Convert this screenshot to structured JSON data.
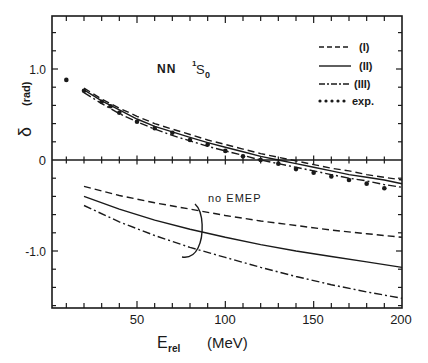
{
  "chart_data": {
    "type": "line",
    "title": "",
    "annotation_top": "NN ¹S₀",
    "annotation_top_parts": {
      "prefix": "NN",
      "sup": "1",
      "main": "S",
      "sub": "0"
    },
    "annotation_bottom": "no EMEP",
    "xlabel": "E_rel (MeV)",
    "xlabel_parts": {
      "main": "E",
      "sub": "rel",
      "unit": "(MeV)"
    },
    "ylabel": "δ (rad)",
    "ylabel_parts": {
      "symbol": "δ",
      "unit": "(rad)"
    },
    "xlim": [
      2,
      200
    ],
    "ylim": [
      -1.62,
      1.58
    ],
    "x_ticks": [
      50,
      100,
      150,
      200
    ],
    "x_tick_labels": [
      "50",
      "100",
      "150",
      "200"
    ],
    "y_ticks": [
      1.0,
      0,
      -1.0
    ],
    "y_tick_labels": [
      "1.0",
      "0",
      "-1.0"
    ],
    "grid": false,
    "legend_position": "upper right",
    "legend": [
      {
        "label": "(I)",
        "style": "dashed"
      },
      {
        "label": "(II)",
        "style": "solid"
      },
      {
        "label": "(III)",
        "style": "dash-dot"
      },
      {
        "label": "exp.",
        "style": "dots"
      }
    ],
    "series": [
      {
        "name": "(I)",
        "style": "dashed",
        "panel": "with EMEP",
        "x": [
          20,
          30,
          40,
          50,
          60,
          70,
          80,
          90,
          100,
          110,
          120,
          130,
          140,
          150,
          160,
          170,
          180,
          190,
          200
        ],
        "values": [
          0.79,
          0.67,
          0.57,
          0.48,
          0.4,
          0.34,
          0.28,
          0.22,
          0.17,
          0.12,
          0.07,
          0.03,
          -0.01,
          -0.05,
          -0.09,
          -0.12,
          -0.16,
          -0.19,
          -0.22
        ]
      },
      {
        "name": "(II)",
        "style": "solid",
        "panel": "with EMEP",
        "x": [
          20,
          30,
          40,
          50,
          60,
          70,
          80,
          90,
          100,
          110,
          120,
          130,
          140,
          150,
          160,
          170,
          180,
          190,
          200
        ],
        "values": [
          0.77,
          0.65,
          0.55,
          0.45,
          0.37,
          0.31,
          0.25,
          0.19,
          0.14,
          0.09,
          0.04,
          0.0,
          -0.04,
          -0.08,
          -0.12,
          -0.16,
          -0.19,
          -0.22,
          -0.26
        ]
      },
      {
        "name": "(III)",
        "style": "dash-dot",
        "panel": "with EMEP",
        "x": [
          20,
          30,
          40,
          50,
          60,
          70,
          80,
          90,
          100,
          110,
          120,
          130,
          140,
          150,
          160,
          170,
          180,
          190,
          200
        ],
        "values": [
          0.74,
          0.62,
          0.51,
          0.42,
          0.34,
          0.27,
          0.21,
          0.15,
          0.1,
          0.05,
          0.0,
          -0.04,
          -0.08,
          -0.12,
          -0.16,
          -0.2,
          -0.23,
          -0.27,
          -0.3
        ]
      },
      {
        "name": "exp.",
        "style": "dots",
        "x": [
          10,
          20,
          30,
          35,
          40,
          50,
          60,
          70,
          80,
          90,
          100,
          110,
          120,
          130,
          140,
          150,
          160,
          170,
          180,
          190
        ],
        "values": [
          0.88,
          0.76,
          0.64,
          0.59,
          0.52,
          0.42,
          0.35,
          0.3,
          0.22,
          0.17,
          0.1,
          0.04,
          0.0,
          -0.04,
          -0.1,
          -0.14,
          -0.18,
          -0.22,
          -0.26,
          -0.31
        ]
      },
      {
        "name": "(I) no EMEP",
        "style": "dashed",
        "panel": "no EMEP",
        "x": [
          20,
          40,
          60,
          80,
          100,
          120,
          140,
          160,
          180,
          200
        ],
        "values": [
          -0.29,
          -0.39,
          -0.47,
          -0.54,
          -0.61,
          -0.67,
          -0.72,
          -0.77,
          -0.81,
          -0.85
        ]
      },
      {
        "name": "(II) no EMEP",
        "style": "solid",
        "panel": "no EMEP",
        "x": [
          20,
          40,
          60,
          80,
          100,
          120,
          140,
          160,
          180,
          200
        ],
        "values": [
          -0.4,
          -0.54,
          -0.66,
          -0.76,
          -0.85,
          -0.93,
          -1.0,
          -1.06,
          -1.12,
          -1.18
        ]
      },
      {
        "name": "(III) no EMEP",
        "style": "dash-dot",
        "panel": "no EMEP",
        "x": [
          20,
          40,
          60,
          80,
          100,
          120,
          140,
          160,
          180,
          200
        ],
        "values": [
          -0.5,
          -0.68,
          -0.83,
          -0.96,
          -1.07,
          -1.18,
          -1.28,
          -1.37,
          -1.45,
          -1.52
        ]
      }
    ]
  }
}
